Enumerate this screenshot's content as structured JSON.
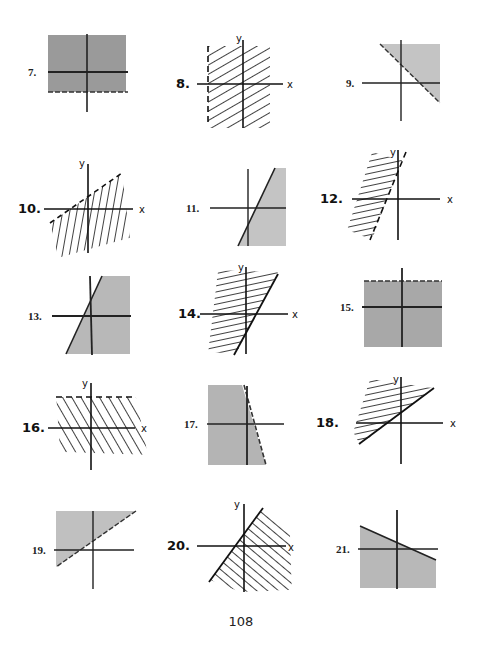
{
  "page": {
    "page_number": "108"
  },
  "graphs": [
    {
      "label": "7.",
      "style": "shaded",
      "description": "Shaded band between horizontal lines, dashed bottom boundary"
    },
    {
      "label": "8.",
      "style": "hatched",
      "description": "Region right of dashed vertical line",
      "axis_x": "x",
      "axis_y": "y"
    },
    {
      "label": "9.",
      "style": "shaded",
      "description": "Region above/right of dashed line with negative slope"
    },
    {
      "label": "10.",
      "style": "hatched",
      "description": "Region below dashed line with positive slope",
      "axis_x": "x",
      "axis_y": "y"
    },
    {
      "label": "11.",
      "style": "shaded",
      "description": "Region right of solid steep line"
    },
    {
      "label": "12.",
      "style": "hatched",
      "description": "Region left of dashed steep line",
      "axis_x": "x",
      "axis_y": "y"
    },
    {
      "label": "13.",
      "style": "shaded",
      "description": "Region right of solid steep line"
    },
    {
      "label": "14.",
      "style": "hatched",
      "description": "Region left of solid steep line",
      "axis_x": "x",
      "axis_y": "y"
    },
    {
      "label": "15.",
      "style": "shaded",
      "description": "Region below dashed horizontal line"
    },
    {
      "label": "16.",
      "style": "hatched",
      "description": "Region below dashed horizontal line",
      "axis_x": "x",
      "axis_y": "y"
    },
    {
      "label": "17.",
      "style": "shaded",
      "description": "Region left of dashed steep negative-slope line"
    },
    {
      "label": "18.",
      "style": "hatched",
      "description": "Region above solid positive-slope line",
      "axis_x": "x",
      "axis_y": "y"
    },
    {
      "label": "19.",
      "style": "shaded",
      "description": "Region above dashed positive-slope line"
    },
    {
      "label": "20.",
      "style": "hatched",
      "description": "Region right of solid positive-slope line",
      "axis_x": "x",
      "axis_y": "y"
    },
    {
      "label": "21.",
      "style": "shaded",
      "description": "Region below solid negative-slope line"
    }
  ]
}
